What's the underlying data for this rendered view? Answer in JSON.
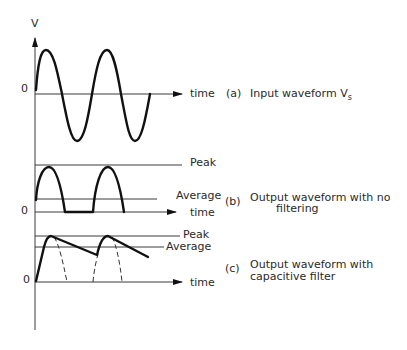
{
  "diagram": {
    "axis": {
      "y_label": "V",
      "zero_label": "0",
      "x_label": "time"
    },
    "panels": [
      {
        "id": "a",
        "caption_letter": "(a)",
        "caption_line1": "Input waveform V",
        "caption_subscript": "s",
        "zero_label": "0",
        "time_label": "time",
        "waveform": "full sine wave"
      },
      {
        "id": "b",
        "caption_letter": "(b)",
        "caption_line1": "Output waveform with no",
        "caption_line2": "filtering",
        "zero_label": "0",
        "time_label": "time",
        "peak_label": "Peak",
        "average_label": "Average",
        "waveform": "half-wave rectified"
      },
      {
        "id": "c",
        "caption_letter": "(c)",
        "caption_line1": "Output waveform with",
        "caption_line2": "capacitive filter",
        "zero_label": "0",
        "time_label": "time",
        "peak_label": "Peak",
        "average_label": "Average",
        "waveform": "capacitor-filtered ripple with dashed unfiltered half-waves"
      }
    ],
    "colors": {
      "ink": "#111111",
      "background": "#ffffff"
    }
  }
}
